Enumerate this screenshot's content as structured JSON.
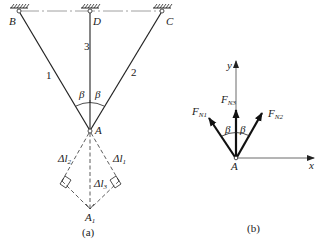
{
  "figure_a": {
    "caption": "(a)",
    "points": {
      "B": "B",
      "D": "D",
      "C": "C",
      "A": "A",
      "A1_base": "A",
      "A1_sub": "1"
    },
    "bars": {
      "bar1": "1",
      "bar2": "2",
      "bar3": "3"
    },
    "angles": {
      "left": "β",
      "right": "β"
    },
    "deformations": {
      "dl2_prefix": "Δl",
      "dl2_sub": "2",
      "dl1_prefix": "Δl",
      "dl1_sub": "1",
      "dl3_prefix": "Δl",
      "dl3_sub": "3"
    }
  },
  "figure_b": {
    "caption": "(b)",
    "axes": {
      "x": "x",
      "y": "y"
    },
    "origin": "A",
    "forces": {
      "fn1_base": "F",
      "fn1_sub": "N1",
      "fn2_base": "F",
      "fn2_sub": "N2",
      "fn3_base": "F",
      "fn3_sub": "N3"
    },
    "angles": {
      "left": "β",
      "right": "β"
    }
  }
}
